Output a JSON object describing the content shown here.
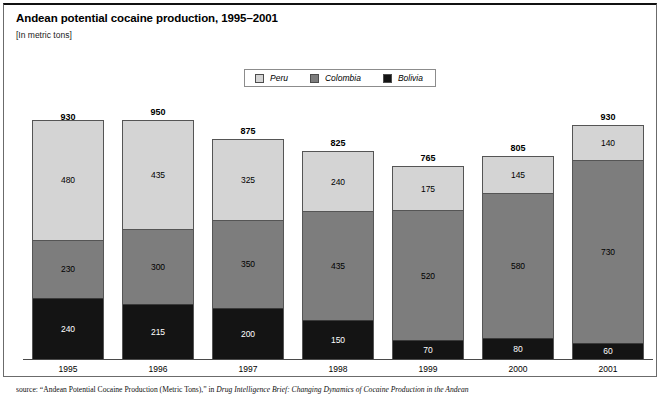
{
  "header": {
    "title": "Andean potential cocaine production, 1995–2001",
    "subtitle": "[In metric tons]"
  },
  "legend": {
    "position": "top-center",
    "items": [
      {
        "label": "Peru",
        "color": "#d4d4d4",
        "icon": "legend-swatch-icon"
      },
      {
        "label": "Colombia",
        "color": "#7d7d7d",
        "icon": "legend-swatch-icon"
      },
      {
        "label": "Bolivia",
        "color": "#141414",
        "icon": "legend-swatch-icon"
      }
    ]
  },
  "source": {
    "prefix": "source:",
    "quoted": "“Andean Potential Cocaine Production (Metric Tons),”",
    "in": "in",
    "italic": "Drug Intelligence Brief: Changing Dynamics of Cocaine Production in the Andean"
  },
  "chart_data": {
    "type": "bar",
    "subtype": "stacked-vertical",
    "title": "Andean potential cocaine production, 1995–2001",
    "subtitle": "[In metric tons]",
    "xlabel": "",
    "ylabel": "metric tons",
    "ylim": [
      0,
      950
    ],
    "grid": false,
    "legend_position": "top-center",
    "categories": [
      "1995",
      "1996",
      "1997",
      "1998",
      "1999",
      "2000",
      "2001"
    ],
    "series": [
      {
        "name": "Bolivia",
        "color": "#141414",
        "values": [
          240,
          215,
          200,
          150,
          70,
          80,
          60
        ]
      },
      {
        "name": "Colombia",
        "color": "#7d7d7d",
        "values": [
          230,
          300,
          350,
          435,
          520,
          580,
          730
        ]
      },
      {
        "name": "Peru",
        "color": "#d4d4d4",
        "values": [
          480,
          435,
          325,
          240,
          175,
          145,
          140
        ]
      }
    ],
    "totals": [
      930,
      950,
      875,
      825,
      765,
      805,
      930
    ],
    "bars": [
      {
        "category": "1995",
        "total": 930,
        "peru": 480,
        "colombia": 230,
        "bolivia": 240
      },
      {
        "category": "1996",
        "total": 950,
        "peru": 435,
        "colombia": 300,
        "bolivia": 215
      },
      {
        "category": "1997",
        "total": 875,
        "peru": 325,
        "colombia": 350,
        "bolivia": 200
      },
      {
        "category": "1998",
        "total": 825,
        "peru": 240,
        "colombia": 435,
        "bolivia": 150
      },
      {
        "category": "1999",
        "total": 765,
        "peru": 175,
        "colombia": 520,
        "bolivia": 70
      },
      {
        "category": "2000",
        "total": 805,
        "peru": 145,
        "colombia": 580,
        "bolivia": 80
      },
      {
        "category": "2001",
        "total": 930,
        "peru": 140,
        "colombia": 730,
        "bolivia": 60
      }
    ]
  }
}
